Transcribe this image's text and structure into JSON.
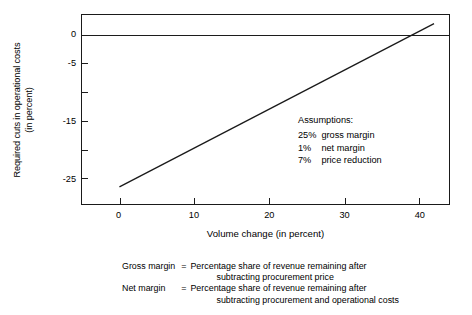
{
  "chart_data": {
    "type": "line",
    "title": "",
    "xlabel": "Volume change (in percent)",
    "ylabel_line1": "Required cuts in operational costs",
    "ylabel_line2": "(in percent)",
    "xlim": [
      -5,
      44
    ],
    "ylim": [
      -29.5,
      3.5
    ],
    "xticks": [
      0,
      10,
      20,
      30,
      40
    ],
    "xtick_labels": [
      "0",
      "10",
      "20",
      "30",
      "40"
    ],
    "yticks": [
      0,
      -5,
      -10,
      -15,
      -20,
      -25
    ],
    "ytick_labels": [
      "0",
      "-5",
      "",
      "-15",
      "",
      "-25"
    ],
    "grid": false,
    "legend": "none",
    "zero_line": 0,
    "series": [
      {
        "name": "Required cuts in operational costs",
        "color": "#1a1a1a",
        "x": [
          0,
          42
        ],
        "y": [
          -26.5,
          2.0
        ],
        "zero_crossing_x": 38.5
      }
    ]
  },
  "annotations": {
    "assumptions_title": "Assumptions:",
    "rows": [
      {
        "pct": "25%",
        "text": "gross margin"
      },
      {
        "pct": "1%",
        "text": "net margin"
      },
      {
        "pct": "7%",
        "text": "price reduction"
      }
    ]
  },
  "footnotes": [
    {
      "term": "Gross margin",
      "eq": "=",
      "def_line1": "Percentage share of revenue remaining after",
      "def_line2": "subtracting procurement price"
    },
    {
      "term": "Net margin",
      "eq": "=",
      "def_line1": "Percentage share of revenue remaining after",
      "def_line2": "subtracting procurement and operational costs"
    }
  ],
  "colors": {
    "line": "#1a1a1a",
    "axis": "#1a1a1a",
    "background": "#ffffff"
  }
}
